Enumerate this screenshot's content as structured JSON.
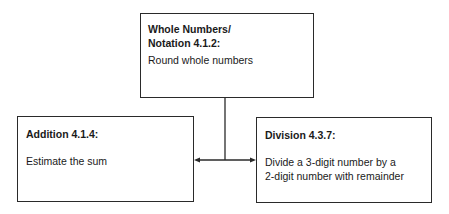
{
  "diagram": {
    "top_box": {
      "title_line1": "Whole Numbers/",
      "title_line2": "Notation 4.1.2:",
      "text": "Round whole numbers"
    },
    "left_box": {
      "title": "Addition 4.1.4:",
      "text": "Estimate the sum"
    },
    "right_box": {
      "title": "Division 4.3.7:",
      "text_line1": "Divide a 3-digit number by a",
      "text_line2": "2-digit number with remainder"
    },
    "connectors": [
      {
        "from": "top_box",
        "to": "left_box",
        "arrow": "end"
      },
      {
        "from": "top_box",
        "to": "right_box",
        "arrow": "end"
      }
    ],
    "line_color": "#2a2a2a"
  }
}
